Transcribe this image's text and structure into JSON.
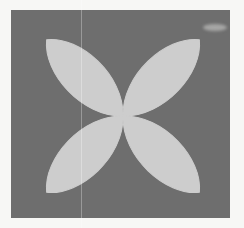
{
  "figure": {
    "name": "four-petal-rose-curve",
    "background_color": "#f7f7f5",
    "panel": {
      "fill_color": "#6e6e6e",
      "x": 11,
      "y": 10,
      "width": 219,
      "height": 208
    },
    "artifacts": {
      "scan_line_x": 81,
      "smudge": {
        "x": 203,
        "y": 24,
        "width": 24,
        "height": 7
      }
    }
  },
  "chart_data": {
    "type": "line",
    "title": "",
    "subtitle": "",
    "xlabel": "",
    "ylabel": "",
    "curve": "rose",
    "equation": "r = a*cos(2*theta)",
    "petal_count": 4,
    "fill": true,
    "fill_color": "#cdcdcd",
    "line_color": "#cdcdcd",
    "grid": false,
    "legend": "none",
    "axis_visible": false,
    "tick_labels_x": [],
    "tick_labels_y": [],
    "xlim": [
      -1.15,
      1.15
    ],
    "ylim": [
      -1.15,
      1.15
    ],
    "center": {
      "x": 123,
      "y": 116
    },
    "amplitude_px": 108,
    "petal_half_width_px": 29,
    "petals": [
      {
        "name": "upper-left",
        "angle_deg": 135,
        "tip_x": 17,
        "tip_y": 34
      },
      {
        "name": "upper-right",
        "angle_deg": 45,
        "tip_x": 206,
        "tip_y": 22
      },
      {
        "name": "lower-right",
        "angle_deg": 315,
        "tip_x": 227,
        "tip_y": 194
      },
      {
        "name": "lower-left",
        "angle_deg": 225,
        "tip_x": 40,
        "tip_y": 206
      }
    ]
  }
}
